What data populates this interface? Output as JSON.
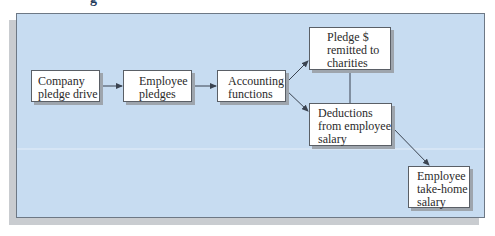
{
  "diagram": {
    "heading_fragment": "g",
    "colors": {
      "panel_bg": "#c7dcf1",
      "panel_border": "#6d7885",
      "shadow": "#c9ccd0",
      "box_bg": "#ffffff",
      "box_border": "#5a5f66",
      "arrow": "#3a4350"
    },
    "nodes": [
      {
        "id": "company-pledge-drive",
        "lines": [
          "Company",
          "pledge drive"
        ]
      },
      {
        "id": "employee-pledges",
        "lines": [
          "Employee",
          "pledges"
        ]
      },
      {
        "id": "accounting-functions",
        "lines": [
          "Accounting",
          "functions"
        ]
      },
      {
        "id": "pledge-remitted",
        "lines": [
          "Pledge $",
          "remitted to",
          "charities"
        ]
      },
      {
        "id": "deductions",
        "lines": [
          "Deductions",
          "from employee",
          "salary"
        ]
      },
      {
        "id": "take-home-salary",
        "lines": [
          "Employee",
          "take-home",
          "salary"
        ]
      }
    ],
    "edges": [
      {
        "from": "company-pledge-drive",
        "to": "employee-pledges",
        "type": "arrow"
      },
      {
        "from": "employee-pledges",
        "to": "accounting-functions",
        "type": "arrow"
      },
      {
        "from": "accounting-functions",
        "to": "pledge-remitted",
        "type": "arrow"
      },
      {
        "from": "accounting-functions",
        "to": "deductions",
        "type": "arrow"
      },
      {
        "from": "pledge-remitted",
        "to": "deductions",
        "type": "line"
      },
      {
        "from": "deductions",
        "to": "take-home-salary",
        "type": "arrow"
      }
    ]
  }
}
